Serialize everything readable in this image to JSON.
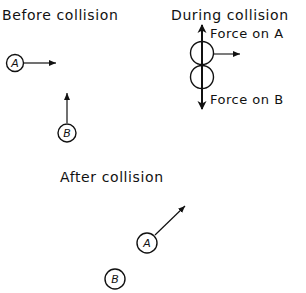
{
  "diagram": {
    "panels": {
      "before": {
        "title": "Before collision",
        "ball_a": {
          "label": "A",
          "velocity_direction": "right"
        },
        "ball_b": {
          "label": "B",
          "velocity_direction": "up"
        }
      },
      "during": {
        "title": "During collision",
        "force_on_a_label": "Force on A",
        "force_on_b_label": "Force on B",
        "force_on_a_direction": "up",
        "force_on_b_direction": "down",
        "velocity_direction": "right"
      },
      "after": {
        "title": "After collision",
        "ball_a": {
          "label": "A",
          "velocity_direction": "up-right"
        },
        "ball_b": {
          "label": "B",
          "velocity_direction": "none"
        }
      }
    },
    "colors": {
      "ink": "#111111",
      "background": "#ffffff"
    }
  }
}
